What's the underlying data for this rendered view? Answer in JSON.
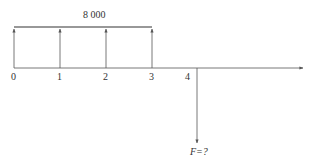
{
  "diagram": {
    "type": "cash-flow-diagram",
    "colors": {
      "line": "#555555",
      "text": "#333333",
      "background": "#ffffff"
    },
    "amount_label": "8 000",
    "unknown_label": "F=?",
    "periods": [
      "0",
      "1",
      "2",
      "3",
      "4"
    ],
    "inflows": [
      {
        "period": "0",
        "amount": 8000
      },
      {
        "period": "1",
        "amount": 8000
      },
      {
        "period": "2",
        "amount": 8000
      },
      {
        "period": "3",
        "amount": 8000
      }
    ],
    "outflow": {
      "period": "4",
      "amount": "F=?"
    }
  }
}
